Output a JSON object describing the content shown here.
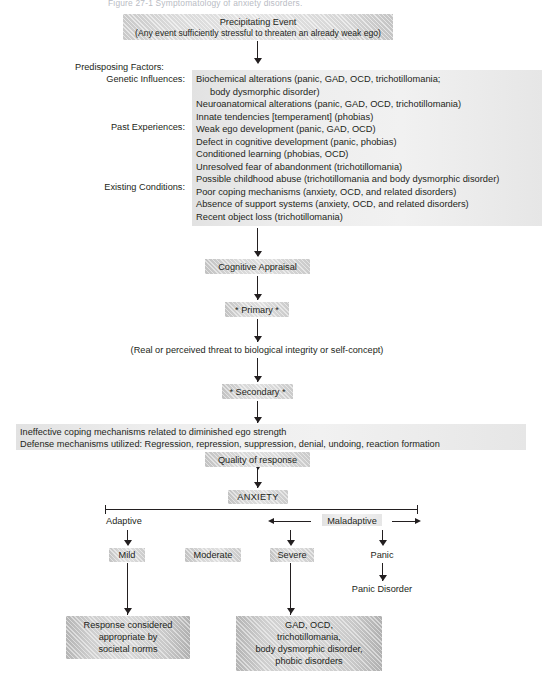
{
  "figure": {
    "top_caption": "Figure 27-1  Symptomatology of anxiety disorders.",
    "precipitating_event": {
      "title": "Precipitating Event",
      "subtitle": "(Any event sufficiently stressful to threaten an already weak ego)"
    },
    "predisposing": {
      "heading": "Predisposing Factors:",
      "categories": [
        {
          "label": "Genetic Influences:"
        },
        {
          "label": "Past Experiences:"
        },
        {
          "label": "Existing Conditions:"
        }
      ],
      "items": [
        "Biochemical alterations (panic, GAD, OCD, trichotillomania;",
        "body dysmorphic disorder)",
        "Neuroanatomical alterations (panic, GAD, OCD, trichotillomania)",
        "Innate tendencies [temperament] (phobias)",
        "Weak ego development (panic, GAD, OCD)",
        "Defect in cognitive development (panic, phobias)",
        "Conditioned learning (phobias, OCD)",
        "Unresolved fear of abandonment (trichotillomania)",
        "Possible childhood abuse (trichotillomania and body dysmorphic disorder)",
        "Poor coping mechanisms (anxiety, OCD, and related disorders)",
        "Absence of support systems (anxiety, OCD, and related disorders)",
        "Recent object loss (trichotillomania)"
      ]
    },
    "cognitive_appraisal": "Cognitive Appraisal",
    "primary": "* Primary *",
    "threat_note": "(Real or perceived threat to biological integrity or self-concept)",
    "secondary": "* Secondary *",
    "coping": {
      "line1": "Ineffective coping mechanisms related to diminished ego strength",
      "line2": "Defense mechanisms utilized: Regression, repression, suppression, denial, undoing, reaction formation"
    },
    "quality_of_response": "Quality of response",
    "anxiety": "ANXIETY",
    "scale": {
      "adaptive": "Adaptive",
      "maladaptive": "Maladaptive"
    },
    "levels": [
      {
        "name": "Mild"
      },
      {
        "name": "Moderate"
      },
      {
        "name": "Severe"
      },
      {
        "name": "Panic"
      }
    ],
    "panic_disorder": "Panic Disorder",
    "outcomes": [
      {
        "id": "adaptive-outcome",
        "lines": [
          "Response considered",
          "appropriate by",
          "societal norms"
        ]
      },
      {
        "id": "maladaptive-outcome",
        "lines": [
          "GAD, OCD,",
          "trichotillomania,",
          "body dysmorphic disorder,",
          "phobic disorders"
        ]
      }
    ]
  },
  "colors": {
    "ink": "#231f20",
    "box_fill": "#d9d9d9",
    "box_fill_strong": "#c6c6c6",
    "box_fill_soft": "#ededed",
    "page": "#ffffff"
  }
}
